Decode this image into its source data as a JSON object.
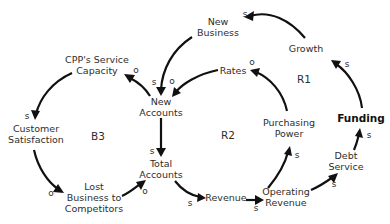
{
  "nodes": {
    "new_business": {
      "lines": [
        "New",
        "Business"
      ]
    },
    "growth": {
      "lines": [
        "Growth"
      ]
    },
    "rates": {
      "lines": [
        "Rates"
      ]
    },
    "cpp_capacity": {
      "lines": [
        "CPP's Service",
        "Capacity"
      ]
    },
    "new_accounts": {
      "lines": [
        "New",
        "Accounts"
      ]
    },
    "customer_satisfaction": {
      "lines": [
        "Customer",
        "Satisfaction"
      ]
    },
    "purchasing_power": {
      "lines": [
        "Purchasing",
        "Power"
      ]
    },
    "funding": {
      "lines": [
        "Funding"
      ]
    },
    "total_accounts": {
      "lines": [
        "Total",
        "Accounts"
      ]
    },
    "debt_service": {
      "lines": [
        "Debt",
        "Service"
      ]
    },
    "lost_business": {
      "lines": [
        "Lost",
        "Business to",
        "Competitors"
      ]
    },
    "revenue": {
      "lines": [
        "Revenue"
      ]
    },
    "operating_revenue": {
      "lines": [
        "Operating",
        "Revenue"
      ]
    }
  },
  "loops": {
    "r1": "R1",
    "r2": "R2",
    "b3": "B3"
  },
  "links": [
    {
      "from": "Growth",
      "to": "New Business",
      "polarity": "s"
    },
    {
      "from": "New Business",
      "to": "New Accounts",
      "polarity": "s"
    },
    {
      "from": "Rates",
      "to": "New Accounts",
      "polarity": "o"
    },
    {
      "from": "New Accounts",
      "to": "CPP's Service Capacity",
      "polarity": "o"
    },
    {
      "from": "CPP's Service Capacity",
      "to": "Customer Satisfaction",
      "polarity": "s"
    },
    {
      "from": "Customer Satisfaction",
      "to": "Lost Business to Competitors",
      "polarity": "o"
    },
    {
      "from": "Lost Business to Competitors",
      "to": "Total Accounts",
      "polarity": "o"
    },
    {
      "from": "New Accounts",
      "to": "Total Accounts",
      "polarity": "s"
    },
    {
      "from": "Total Accounts",
      "to": "Revenue",
      "polarity": "s"
    },
    {
      "from": "Revenue",
      "to": "Operating Revenue",
      "polarity": "s"
    },
    {
      "from": "Operating Revenue",
      "to": "Purchasing Power",
      "polarity": "s"
    },
    {
      "from": "Purchasing Power",
      "to": "Rates",
      "polarity": "o"
    },
    {
      "from": "Operating Revenue",
      "to": "Debt Service",
      "polarity": "s"
    },
    {
      "from": "Debt Service",
      "to": "Funding",
      "polarity": "s"
    },
    {
      "from": "Funding",
      "to": "Growth",
      "polarity": "s"
    }
  ]
}
